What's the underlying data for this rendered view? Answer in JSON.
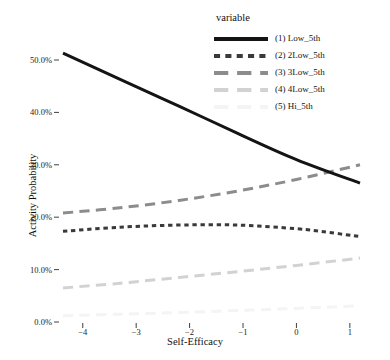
{
  "chart_data": {
    "type": "line",
    "title": "",
    "xlabel": "Self-Efficacy",
    "ylabel": "Activity Probability",
    "xlim": [
      -4.37,
      1.19
    ],
    "ylim": [
      0,
      55
    ],
    "grid": false,
    "legend_position": "top-right",
    "legend_title": "variable",
    "xticks": [
      -4,
      -3,
      -2,
      -1,
      0,
      1
    ],
    "xtick_labels": [
      "−4",
      "−3",
      "−2",
      "−1",
      "0",
      "1"
    ],
    "yticks": [
      0,
      10,
      20,
      30,
      40,
      50
    ],
    "ytick_labels": [
      "0.0%",
      "10.0%",
      "20.0%",
      "30.0%",
      "40.0%",
      "50.0%"
    ],
    "series": [
      {
        "name": "(1) Low_5th",
        "color": "#141414",
        "style": "solid",
        "width": 3.0,
        "x": [
          -4.37,
          -3.3,
          -2.2,
          -1.1,
          0.0,
          1.19
        ],
        "values": [
          51.3,
          46.3,
          41.2,
          36.0,
          31.0,
          26.5
        ]
      },
      {
        "name": "(2) 2Low_5th",
        "color": "#3a3a3a",
        "style": "dotted",
        "width": 3.0,
        "x": [
          -4.37,
          -3.3,
          -2.2,
          -1.1,
          0.0,
          0.6,
          1.19
        ],
        "values": [
          17.3,
          18.1,
          18.5,
          18.5,
          17.8,
          17.1,
          16.3
        ]
      },
      {
        "name": "(3) 3Low_5th",
        "color": "#8c8c8c",
        "style": "dashed",
        "width": 3.0,
        "x": [
          -4.37,
          -3.3,
          -2.2,
          -1.1,
          0.0,
          1.19
        ],
        "values": [
          20.8,
          21.8,
          23.2,
          25.0,
          27.2,
          30.0
        ]
      },
      {
        "name": "(4) 4Low_5th",
        "color": "#d2d2d2",
        "style": "dashed",
        "width": 3.0,
        "x": [
          -4.37,
          -3.3,
          -2.2,
          -1.1,
          0.0,
          1.19
        ],
        "values": [
          6.5,
          7.4,
          8.5,
          9.6,
          10.8,
          12.2
        ]
      },
      {
        "name": "(5) Hi_5th",
        "color": "#f4f4f4",
        "style": "dashed",
        "width": 3.0,
        "x": [
          -4.37,
          -3.3,
          -2.2,
          -1.1,
          0.0,
          1.19
        ],
        "values": [
          1.2,
          1.5,
          1.8,
          2.2,
          2.6,
          3.1
        ]
      }
    ]
  },
  "axes": {
    "y_title": "Activity Probability",
    "x_title": "Self-Efficacy"
  },
  "legend": {
    "title": "variable",
    "items": [
      {
        "label": "(1) Low_5th",
        "color": "#141414",
        "style": "solid"
      },
      {
        "label": "(2) 2Low_5th",
        "color": "#3a3a3a",
        "style": "dotted"
      },
      {
        "label": "(3) 3Low_5th",
        "color": "#8c8c8c",
        "style": "dashed"
      },
      {
        "label": "(4) 4Low_5th",
        "color": "#d2d2d2",
        "style": "dashed"
      },
      {
        "label": "(5) Hi_5th",
        "color": "#f4f4f4",
        "style": "dashed"
      }
    ]
  }
}
